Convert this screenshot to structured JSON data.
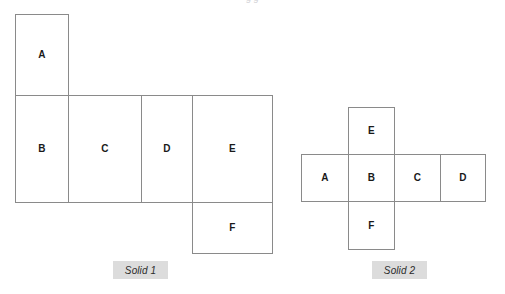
{
  "page": {
    "background_color": "#ffffff",
    "line_color": "#8a8a8a",
    "label_color": "#1a1a1a",
    "caption_background": "#dcdcdc",
    "top_clipped_text": "g g"
  },
  "diagrams": [
    {
      "id": "solid-1",
      "caption": "Solid 1",
      "caption_box": {
        "x": 113,
        "y": 261,
        "width": 55,
        "height": 18
      },
      "faces": [
        {
          "label": "A",
          "x": 15,
          "y": 14,
          "width": 54,
          "height": 82
        },
        {
          "label": "B",
          "x": 15,
          "y": 95,
          "width": 54,
          "height": 108
        },
        {
          "label": "C",
          "x": 68,
          "y": 95,
          "width": 74,
          "height": 108
        },
        {
          "label": "D",
          "x": 141,
          "y": 95,
          "width": 52,
          "height": 108
        },
        {
          "label": "E",
          "x": 192,
          "y": 95,
          "width": 81,
          "height": 108
        },
        {
          "label": "F",
          "x": 192,
          "y": 202,
          "width": 81,
          "height": 52
        }
      ]
    },
    {
      "id": "solid-2",
      "caption": "Solid 2",
      "caption_box": {
        "x": 372,
        "y": 261,
        "width": 55,
        "height": 18
      },
      "faces": [
        {
          "label": "E",
          "x": 348,
          "y": 107,
          "width": 47,
          "height": 48
        },
        {
          "label": "A",
          "x": 301,
          "y": 154,
          "width": 48,
          "height": 48
        },
        {
          "label": "B",
          "x": 348,
          "y": 154,
          "width": 47,
          "height": 48
        },
        {
          "label": "C",
          "x": 394,
          "y": 154,
          "width": 47,
          "height": 48
        },
        {
          "label": "D",
          "x": 440,
          "y": 154,
          "width": 46,
          "height": 48
        },
        {
          "label": "F",
          "x": 348,
          "y": 201,
          "width": 47,
          "height": 49
        }
      ]
    }
  ]
}
